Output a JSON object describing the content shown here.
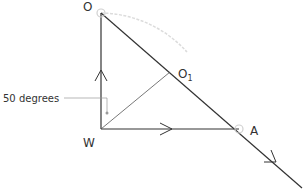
{
  "diagram": {
    "type": "vector-geometry",
    "points": {
      "O": {
        "label": "O",
        "x": 101,
        "y": 13
      },
      "W": {
        "label": "W",
        "x": 101,
        "y": 129
      },
      "A": {
        "label": "A",
        "x": 239,
        "y": 129
      },
      "O1": {
        "label": "O",
        "subscript": "1",
        "x": 170,
        "y": 72
      }
    },
    "annotation": {
      "text": "50 degrees"
    },
    "colors": {
      "line": "#333333",
      "guide": "#8a8a8a",
      "arc": "#d8d8d8",
      "marker": "#c8c8c8"
    }
  }
}
